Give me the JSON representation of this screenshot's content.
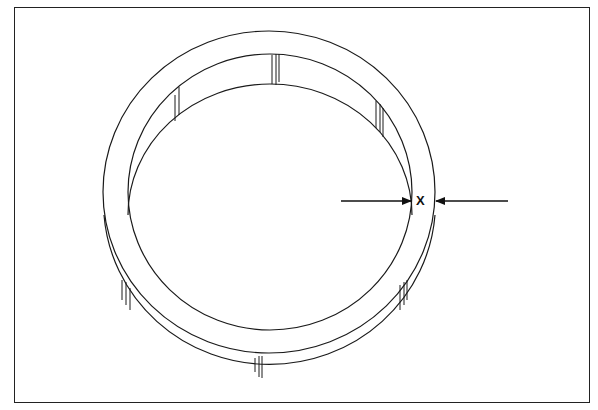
{
  "figure": {
    "type": "technical line drawing",
    "stroke_color": "#1a1a1a",
    "background": "#ffffff"
  },
  "dimension": {
    "label": "X",
    "meaning": "radial wall thickness of ring",
    "left_arrow": {
      "x1": 341,
      "x2": 410,
      "y": 201,
      "direction": "right"
    },
    "right_arrow": {
      "x1": 508,
      "x2": 436,
      "y": 201,
      "direction": "left"
    }
  }
}
